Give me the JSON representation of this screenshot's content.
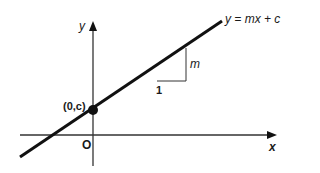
{
  "diagram": {
    "type": "straight-line-graph",
    "axes": {
      "x_label": "x",
      "y_label": "y",
      "origin_label": "O"
    },
    "line": {
      "equation_label": "y = mx + c"
    },
    "intercept": {
      "label": "(0,c)"
    },
    "gradient_triangle": {
      "run_label": "1",
      "rise_label": "m"
    },
    "colors": {
      "line": "#111111",
      "axis": "#333333",
      "background": "#ffffff"
    }
  }
}
